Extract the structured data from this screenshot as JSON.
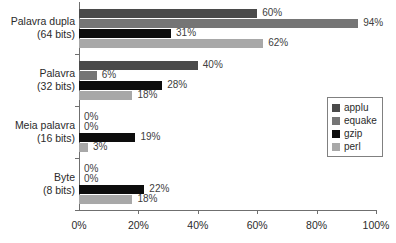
{
  "chart_data": {
    "type": "bar",
    "orientation": "horizontal",
    "title": "",
    "xlabel": "",
    "ylabel": "",
    "xlim": [
      0,
      100
    ],
    "xticks": [
      "0%",
      "20%",
      "40%",
      "60%",
      "80%",
      "100%"
    ],
    "xtick_values": [
      0,
      20,
      40,
      60,
      80,
      100
    ],
    "grid": false,
    "legend_position": "right",
    "categories": [
      {
        "line1": "Palavra dupla",
        "line2": "(64 bits)"
      },
      {
        "line1": "Palavra",
        "line2": "(32 bits)"
      },
      {
        "line1": "Meia palavra",
        "line2": "(16 bits)"
      },
      {
        "line1": "Byte",
        "line2": "(8 bits)"
      }
    ],
    "category_labels": [
      "Palavra dupla (64 bits)",
      "Palavra (32 bits)",
      "Meia palavra (16 bits)",
      "Byte (8 bits)"
    ],
    "series": [
      {
        "name": "applu",
        "color": "#4a4a4a",
        "values": [
          60,
          40,
          0,
          0
        ],
        "labels": [
          "60%",
          "40%",
          "0%",
          "0%"
        ]
      },
      {
        "name": "equake",
        "color": "#757575",
        "values": [
          94,
          6,
          0,
          0
        ],
        "labels": [
          "94%",
          "6%",
          "0%",
          "0%"
        ]
      },
      {
        "name": "gzip",
        "color": "#0d0d0d",
        "values": [
          31,
          28,
          19,
          22
        ],
        "labels": [
          "31%",
          "28%",
          "19%",
          "22%"
        ]
      },
      {
        "name": "perl",
        "color": "#a8a8a8",
        "values": [
          62,
          18,
          3,
          18
        ],
        "labels": [
          "62%",
          "18%",
          "3%",
          "18%"
        ]
      }
    ]
  },
  "legend": {
    "items": [
      {
        "label": "applu",
        "color": "#4a4a4a"
      },
      {
        "label": "equake",
        "color": "#757575"
      },
      {
        "label": "gzip",
        "color": "#0d0d0d"
      },
      {
        "label": "perl",
        "color": "#a8a8a8"
      }
    ]
  },
  "axis": {
    "line_color": "#6f6f6f",
    "text_color": "#2b2b2b"
  }
}
